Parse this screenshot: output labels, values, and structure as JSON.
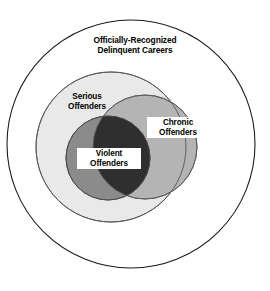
{
  "chart_data": {
    "type": "diagram",
    "diagram_type": "venn",
    "title": "Officially-Recognized Delinquent Careers",
    "sets": [
      {
        "name": "universe",
        "label": "Officially-Recognized\nDelinquent Careers",
        "fill": "#ffffff",
        "stroke": "#1a1a1a",
        "cx": 131,
        "cy": 144,
        "r": 124
      },
      {
        "name": "serious",
        "label": "Serious\nOffenders",
        "fill": "#e9e9e9",
        "stroke": "#555555",
        "cx": 111,
        "cy": 147,
        "r": 75
      },
      {
        "name": "chronic",
        "label": "Chronic\nOffenders",
        "fill": "#b4b4b4",
        "stroke": "#5a5a5a",
        "cx": 145,
        "cy": 147,
        "r": 52
      },
      {
        "name": "violent",
        "label": "Violent\nOffenders",
        "fill": "#8b8b8b",
        "stroke": "#4a4a4a",
        "cx": 108,
        "cy": 158,
        "r": 42
      }
    ],
    "intersections": [
      {
        "name": "violent-chronic",
        "sets": [
          "violent",
          "chronic"
        ],
        "fill": "#2f2f2f"
      }
    ],
    "colors": {
      "background": "#ffffff",
      "outline": "#1a1a1a",
      "serious_fill": "#e9e9e9",
      "chronic_fill": "#b4b4b4",
      "violent_fill": "#8b8b8b",
      "overlap_fill": "#2f2f2f",
      "text": "#000000",
      "label_box": "#ffffff"
    }
  },
  "labels": {
    "universe": "Officially-Recognized\nDelinquent Careers",
    "serious": "Serious\nOffenders",
    "chronic": "Chronic\nOffenders",
    "violent": "Violent\nOffenders"
  }
}
